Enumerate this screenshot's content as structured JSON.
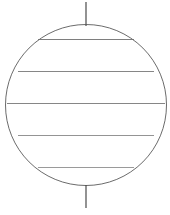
{
  "figure": {
    "name": "sphere-latitude-diagram",
    "title": "Sphere with polar axis and latitude circles",
    "background_color": "#ffffff",
    "canvas": {
      "width": 170,
      "height": 215
    },
    "sphere": {
      "center_x": 86,
      "center_y": 105,
      "radius": 80.5,
      "stroke_color": "#5a5a5a",
      "stroke_width": 0.9,
      "fill": "none"
    },
    "axis": {
      "label": "polar-axis",
      "x": 86,
      "top_start_y": 2,
      "top_end_y": 26,
      "bottom_start_y": 185,
      "bottom_end_y": 208,
      "stroke_color": "#4a4a4a",
      "stroke_width": 1.2
    },
    "latitudes": [
      {
        "label": "latitude-upper-outer",
        "y": 39.5,
        "x1": 38,
        "x2": 134,
        "stroke_color": "#6f6f6f",
        "stroke_width": 0.9
      },
      {
        "label": "latitude-upper-inner",
        "y": 71.5,
        "x1": 18,
        "x2": 154,
        "stroke_color": "#787878",
        "stroke_width": 0.9
      },
      {
        "label": "latitude-equator",
        "y": 103.5,
        "x1": 7,
        "x2": 165,
        "stroke_color": "#787878",
        "stroke_width": 0.9
      },
      {
        "label": "latitude-lower-inner",
        "y": 135.5,
        "x1": 18,
        "x2": 154,
        "stroke_color": "#888888",
        "stroke_width": 0.9
      },
      {
        "label": "latitude-lower-outer",
        "y": 167.5,
        "x1": 38,
        "x2": 134,
        "stroke_color": "#8f8f8f",
        "stroke_width": 0.9
      }
    ],
    "caption": {
      "text": "",
      "visible": false
    }
  }
}
